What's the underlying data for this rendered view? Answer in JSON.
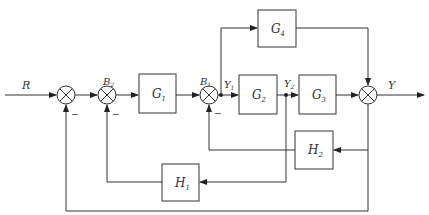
{
  "diagram": {
    "type": "control-system block diagram",
    "input_label": "R",
    "output_label": "Y",
    "colors": {
      "line": "#333333",
      "background": "#ffffff"
    },
    "blocks": [
      {
        "id": "G1",
        "label": "G",
        "sub": "1"
      },
      {
        "id": "G2",
        "label": "G",
        "sub": "2"
      },
      {
        "id": "G3",
        "label": "G",
        "sub": "3"
      },
      {
        "id": "G4",
        "label": "G",
        "sub": "4"
      },
      {
        "id": "H1",
        "label": "H",
        "sub": "1"
      },
      {
        "id": "H2",
        "label": "H",
        "sub": "2"
      }
    ],
    "junction_labels": {
      "B2": {
        "label": "B",
        "sub": "2"
      },
      "B1": {
        "label": "B",
        "sub": "1"
      }
    },
    "signal_labels": {
      "Y1": {
        "label": "Y",
        "sub": "1"
      },
      "Y2": {
        "label": "Y",
        "sub": "2"
      }
    },
    "signs": {
      "minus": "−"
    }
  }
}
